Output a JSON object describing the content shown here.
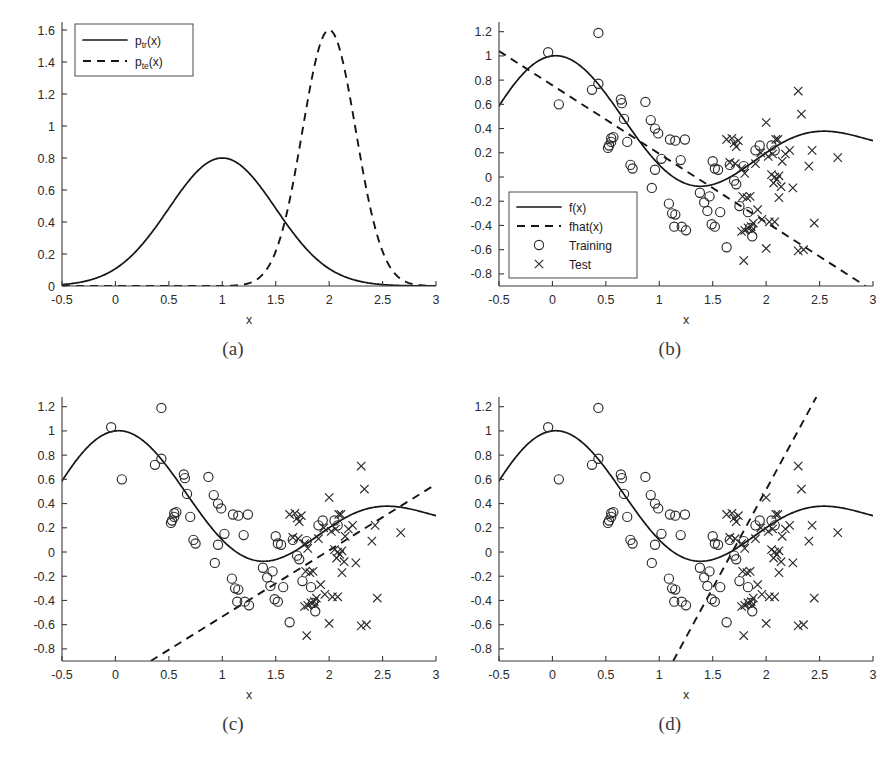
{
  "figure": {
    "captions": [
      "(a)",
      "(b)",
      "(c)",
      "(d)"
    ]
  },
  "chart_data": [
    {
      "id": "panel-a",
      "type": "line",
      "title": "",
      "xlabel": "x",
      "ylabel": "",
      "xlim": [
        -0.5,
        3
      ],
      "ylim": [
        0,
        1.65
      ],
      "xticks": [
        -0.5,
        0,
        0.5,
        1,
        1.5,
        2,
        2.5,
        3
      ],
      "xticklabels": [
        "-0.5",
        "0",
        "0.5",
        "1",
        "1.5",
        "2",
        "2.5",
        "3"
      ],
      "yticks": [
        0,
        0.2,
        0.4,
        0.6,
        0.8,
        1,
        1.2,
        1.4,
        1.6
      ],
      "yticklabels": [
        "0",
        "0.2",
        "0.4",
        "0.6",
        "0.8",
        "1",
        "1.2",
        "1.4",
        "1.6"
      ],
      "grid": false,
      "legend_position": "upper-left",
      "legend": [
        {
          "label": "p",
          "sub": "tr",
          "suffix": "(x)",
          "style": "solid"
        },
        {
          "label": "p",
          "sub": "te",
          "suffix": "(x)",
          "style": "dashed"
        }
      ],
      "series": [
        {
          "name": "p_tr(x)",
          "style": "solid",
          "kind": "gaussian",
          "mu": 1.0,
          "sigma": 0.5,
          "peak": 0.8,
          "comment": "training input density, normal(1, 0.5^2), peak 0.8 at x=1"
        },
        {
          "name": "p_te(x)",
          "style": "dashed",
          "kind": "gaussian",
          "mu": 2.0,
          "sigma": 0.25,
          "peak": 1.6,
          "comment": "test input density, normal(2, 0.25^2), peak 1.6 at x=2"
        }
      ]
    },
    {
      "id": "panel-b",
      "type": "scatter",
      "title": "",
      "xlabel": "x",
      "ylabel": "",
      "xlim": [
        -0.5,
        3
      ],
      "ylim": [
        -0.9,
        1.28
      ],
      "xticks": [
        -0.5,
        0,
        0.5,
        1,
        1.5,
        2,
        2.5,
        3
      ],
      "xticklabels": [
        "-0.5",
        "0",
        "0.5",
        "1",
        "1.5",
        "2",
        "2.5",
        "3"
      ],
      "yticks": [
        -0.8,
        -0.6,
        -0.4,
        -0.2,
        0,
        0.2,
        0.4,
        0.6,
        0.8,
        1,
        1.2
      ],
      "yticklabels": [
        "-0.8",
        "-0.6",
        "-0.4",
        "-0.2",
        "0",
        "0.2",
        "0.4",
        "0.6",
        "0.8",
        "1",
        "1.2"
      ],
      "grid": false,
      "legend_position": "lower-left",
      "legend": [
        {
          "label": "f(x)",
          "style": "solid"
        },
        {
          "label": "fhat(x)",
          "style": "dashed"
        },
        {
          "label": "Training",
          "style": "circle"
        },
        {
          "label": "Test",
          "style": "cross"
        }
      ],
      "fit_line": {
        "name": "fhat(x)",
        "style": "dashed",
        "x0": -0.5,
        "y0": 1.04,
        "x1": 2.93,
        "y1": -0.9,
        "slope": -0.566,
        "intercept": 0.757
      },
      "target_curve": {
        "name": "f(x)",
        "style": "solid",
        "kind": "sinc_like",
        "comment": "f(x)=sinc(x) style damped oscillation, peak 1.0 at x=0, trough -0.21 at x=1.45, bump 0.13 at x=2.5"
      }
    },
    {
      "id": "panel-c",
      "type": "scatter",
      "title": "",
      "xlabel": "x",
      "ylabel": "",
      "xlim": [
        -0.5,
        3
      ],
      "ylim": [
        -0.9,
        1.28
      ],
      "xticks": [
        -0.5,
        0,
        0.5,
        1,
        1.5,
        2,
        2.5,
        3
      ],
      "xticklabels": [
        "-0.5",
        "0",
        "0.5",
        "1",
        "1.5",
        "2",
        "2.5",
        "3"
      ],
      "yticks": [
        -0.8,
        -0.6,
        -0.4,
        -0.2,
        0,
        0.2,
        0.4,
        0.6,
        0.8,
        1,
        1.2
      ],
      "yticklabels": [
        "-0.8",
        "-0.6",
        "-0.4",
        "-0.2",
        "0",
        "0.2",
        "0.4",
        "0.6",
        "0.8",
        "1",
        "1.2"
      ],
      "grid": false,
      "legend_position": "none",
      "legend": [],
      "fit_line": {
        "name": "fhat(x)",
        "style": "dashed",
        "x0": 0.33,
        "y0": -0.9,
        "x1": 3.0,
        "y1": 0.56,
        "slope": 0.547,
        "intercept": -1.08
      },
      "target_curve": {
        "name": "f(x)",
        "style": "solid",
        "kind": "sinc_like",
        "comment": "same f(x) as panel b"
      }
    },
    {
      "id": "panel-d",
      "type": "scatter",
      "title": "",
      "xlabel": "x",
      "ylabel": "",
      "xlim": [
        -0.5,
        3
      ],
      "ylim": [
        -0.9,
        1.28
      ],
      "xticks": [
        -0.5,
        0,
        0.5,
        1,
        1.5,
        2,
        2.5,
        3
      ],
      "xticklabels": [
        "-0.5",
        "0",
        "0.5",
        "1",
        "1.5",
        "2",
        "2.5",
        "3"
      ],
      "yticks": [
        -0.8,
        -0.6,
        -0.4,
        -0.2,
        0,
        0.2,
        0.4,
        0.6,
        0.8,
        1,
        1.2
      ],
      "yticklabels": [
        "-0.8",
        "-0.6",
        "-0.4",
        "-0.2",
        "0",
        "0.2",
        "0.4",
        "0.6",
        "0.8",
        "1",
        "1.2"
      ],
      "grid": false,
      "legend_position": "none",
      "legend": [],
      "fit_line": {
        "name": "fhat(x)",
        "style": "dashed",
        "x0": 1.13,
        "y0": -0.9,
        "x1": 2.47,
        "y1": 1.28,
        "slope": 1.627,
        "intercept": -2.739
      },
      "target_curve": {
        "name": "f(x)",
        "style": "solid",
        "kind": "sinc_like",
        "comment": "same f(x) as panel b"
      }
    }
  ],
  "points": {
    "training": [
      [
        -0.04,
        1.03
      ],
      [
        0.06,
        0.6
      ],
      [
        0.43,
        1.19
      ],
      [
        0.37,
        0.72
      ],
      [
        0.43,
        0.77
      ],
      [
        0.52,
        0.24
      ],
      [
        0.53,
        0.26
      ],
      [
        0.55,
        0.32
      ],
      [
        0.57,
        0.33
      ],
      [
        0.55,
        0.29
      ],
      [
        0.64,
        0.64
      ],
      [
        0.65,
        0.61
      ],
      [
        0.67,
        0.48
      ],
      [
        0.7,
        0.29
      ],
      [
        0.75,
        0.07
      ],
      [
        0.73,
        0.1
      ],
      [
        0.87,
        0.62
      ],
      [
        0.92,
        0.47
      ],
      [
        0.96,
        0.4
      ],
      [
        0.99,
        0.36
      ],
      [
        0.93,
        -0.09
      ],
      [
        0.96,
        0.06
      ],
      [
        1.02,
        0.15
      ],
      [
        1.1,
        0.31
      ],
      [
        1.15,
        0.3
      ],
      [
        1.2,
        0.14
      ],
      [
        1.24,
        0.31
      ],
      [
        1.09,
        -0.22
      ],
      [
        1.12,
        -0.3
      ],
      [
        1.15,
        -0.31
      ],
      [
        1.14,
        -0.41
      ],
      [
        1.21,
        -0.41
      ],
      [
        1.25,
        -0.44
      ],
      [
        1.38,
        -0.13
      ],
      [
        1.42,
        -0.21
      ],
      [
        1.47,
        -0.16
      ],
      [
        1.45,
        -0.28
      ],
      [
        1.49,
        -0.39
      ],
      [
        1.52,
        -0.41
      ],
      [
        1.5,
        0.13
      ],
      [
        1.52,
        0.07
      ],
      [
        1.55,
        0.06
      ],
      [
        1.57,
        -0.29
      ],
      [
        1.63,
        -0.58
      ],
      [
        1.66,
        0.1
      ],
      [
        1.7,
        -0.03
      ],
      [
        1.72,
        -0.06
      ],
      [
        1.75,
        -0.24
      ],
      [
        1.79,
        0.09
      ],
      [
        1.83,
        -0.29
      ],
      [
        1.85,
        -0.42
      ],
      [
        1.87,
        -0.49
      ],
      [
        1.9,
        0.22
      ],
      [
        1.94,
        0.26
      ],
      [
        2.05,
        0.26
      ],
      [
        2.08,
        0.22
      ]
    ],
    "test": [
      [
        1.63,
        0.31
      ],
      [
        1.68,
        0.32
      ],
      [
        1.7,
        0.28
      ],
      [
        1.72,
        0.25
      ],
      [
        1.74,
        0.3
      ],
      [
        1.66,
        0.12
      ],
      [
        1.71,
        0.11
      ],
      [
        1.77,
        0.07
      ],
      [
        1.8,
        0.03
      ],
      [
        1.78,
        -0.16
      ],
      [
        1.82,
        -0.17
      ],
      [
        1.85,
        -0.16
      ],
      [
        1.8,
        -0.44
      ],
      [
        1.83,
        -0.42
      ],
      [
        1.86,
        -0.41
      ],
      [
        1.88,
        -0.38
      ],
      [
        1.77,
        -0.45
      ],
      [
        1.79,
        -0.69
      ],
      [
        1.9,
        0.11
      ],
      [
        1.95,
        0.2
      ],
      [
        2.0,
        0.45
      ],
      [
        2.02,
        0.17
      ],
      [
        2.06,
        0.19
      ],
      [
        2.09,
        0.31
      ],
      [
        2.11,
        0.31
      ],
      [
        2.05,
        0.02
      ],
      [
        2.08,
        0.0
      ],
      [
        2.1,
        -0.02
      ],
      [
        2.12,
        0.01
      ],
      [
        2.07,
        -0.05
      ],
      [
        2.0,
        -0.59
      ],
      [
        2.03,
        -0.37
      ],
      [
        2.08,
        -0.37
      ],
      [
        2.12,
        -0.17
      ],
      [
        2.15,
        0.13
      ],
      [
        2.18,
        0.19
      ],
      [
        2.22,
        0.22
      ],
      [
        2.25,
        -0.09
      ],
      [
        2.3,
        0.71
      ],
      [
        2.33,
        0.52
      ],
      [
        2.4,
        0.09
      ],
      [
        2.43,
        0.22
      ],
      [
        2.35,
        -0.6
      ],
      [
        2.3,
        -0.61
      ],
      [
        2.45,
        -0.38
      ],
      [
        2.67,
        0.16
      ],
      [
        1.92,
        -0.27
      ],
      [
        1.96,
        -0.35
      ],
      [
        1.87,
        -0.44
      ],
      [
        2.14,
        -0.08
      ]
    ]
  }
}
